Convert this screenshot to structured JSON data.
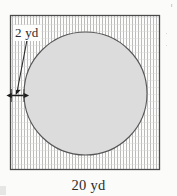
{
  "figure": {
    "type": "geometry-diagram",
    "background_color": "#fbfbfa",
    "labels": {
      "gap_label": "2 yd",
      "side_label": "20 yd"
    },
    "square": {
      "name": "outer-square",
      "side_length_value": 20,
      "units": "yd",
      "x": 10,
      "y": 15,
      "width": 150,
      "height": 155,
      "stroke_color": "#4a4a4a",
      "fill_pattern": "vertical-hatching",
      "hatch_color": "#b8b8b8",
      "hatch_spacing": 3
    },
    "circle": {
      "name": "inscribed-circle",
      "cx": 85.5,
      "cy": 93.5,
      "r": 61.5,
      "diameter_value": 16,
      "units": "yd",
      "fill_color": "#dcdcdc",
      "stroke_color": "#555555"
    },
    "gap_dimension": {
      "name": "border-width-arrow",
      "value": 2,
      "units": "yd",
      "x1": 11,
      "x2": 24,
      "y": 95,
      "stroke_color": "#1c1c1c",
      "double_headed": true
    },
    "leader_line": {
      "name": "gap-leader-line",
      "x1": 27,
      "y1": 40,
      "x2": 17,
      "y2": 92,
      "stroke_color": "#2a2a2a"
    }
  },
  "chart_data": {
    "type": "diagram",
    "title": "",
    "shapes": [
      {
        "shape": "square",
        "label": "20 yd",
        "side": 20,
        "units": "yd"
      },
      {
        "shape": "circle",
        "label": "",
        "diameter": 16,
        "units": "yd",
        "shaded": true
      }
    ],
    "annotations": [
      {
        "text": "2 yd",
        "meaning": "uniform border width between square edge and circle"
      },
      {
        "text": "20 yd",
        "meaning": "length of each side of the square"
      }
    ]
  }
}
